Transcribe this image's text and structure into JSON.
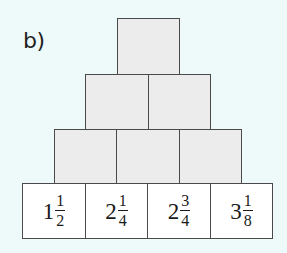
{
  "label": "b)",
  "pyramid": {
    "rows": [
      {
        "row": 1,
        "cells": [
          {
            "value": ""
          }
        ]
      },
      {
        "row": 2,
        "cells": [
          {
            "value": ""
          },
          {
            "value": ""
          }
        ]
      },
      {
        "row": 3,
        "cells": [
          {
            "value": ""
          },
          {
            "value": ""
          },
          {
            "value": ""
          }
        ]
      },
      {
        "row": 4,
        "cells": [
          {
            "whole": "1",
            "num": "1",
            "den": "2"
          },
          {
            "whole": "2",
            "num": "1",
            "den": "4"
          },
          {
            "whole": "2",
            "num": "3",
            "den": "4"
          },
          {
            "whole": "3",
            "num": "1",
            "den": "8"
          }
        ]
      }
    ]
  },
  "colors": {
    "background": "#eef9f9",
    "empty_fill": "#ececec",
    "base_fill": "#ffffff",
    "border": "#4a4a4a"
  }
}
